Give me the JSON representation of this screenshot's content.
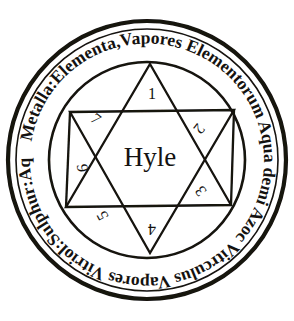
{
  "figure": {
    "kind": "alchemical-diagram",
    "ink_color": "#141210",
    "paper_color": "#ffffff"
  },
  "center": {
    "label": "Hyle"
  },
  "ring": {
    "inscription": "Metalla:Elementa,Vapores Elementorum Aqua demi Azoc Vitrculus Vapores Vitriol:Sulphur:Aqueum:",
    "segments": [
      "Metalla:",
      "Elementa,",
      "Vapores",
      "Elementorum",
      "Aqua demi",
      "Azoc",
      "Vitrculus",
      "Vapores",
      "Vitriol:",
      "Sulphur:",
      "Aqueum:"
    ]
  },
  "star": {
    "points": [
      {
        "numeral": "1",
        "position": "top"
      },
      {
        "numeral": "2",
        "position": "upper-right"
      },
      {
        "numeral": "3",
        "position": "lower-right"
      },
      {
        "numeral": "4",
        "position": "bottom"
      },
      {
        "numeral": "5",
        "position": "lower-left"
      },
      {
        "numeral": "6",
        "position": "left"
      },
      {
        "numeral": "7",
        "position": "upper-left"
      }
    ]
  }
}
